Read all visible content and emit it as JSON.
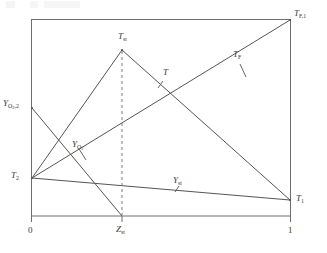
{
  "figure": {
    "type": "line-diagram",
    "frame_color": "#6e6e6e",
    "line_color": "#555555",
    "dashed_color": "#7a7a7a",
    "text_color": "#3a3a3a",
    "background": "#ffffff"
  },
  "axes": {
    "x_ticks": [
      {
        "id": "x0",
        "label": "0",
        "value": 0
      },
      {
        "id": "xst",
        "label": "Z",
        "sub": "st",
        "value": 0.35
      },
      {
        "id": "x1",
        "label": "1",
        "value": 1
      }
    ],
    "x_range": [
      0,
      1
    ],
    "grid": false
  },
  "labels": {
    "t_st": {
      "text": "T",
      "sub": "st"
    },
    "t_f1": {
      "text": "T",
      "sub": "F,1"
    },
    "t_f": {
      "text": "T",
      "sub": "F"
    },
    "t": {
      "text": "T",
      "sub": ""
    },
    "t_1": {
      "text": "T",
      "sub": "1"
    },
    "t_2": {
      "text": "T",
      "sub": "2"
    },
    "y_o2_2": {
      "text": "Y",
      "sub": "O2,2"
    },
    "y_o2": {
      "text": "Y",
      "sub": "O2"
    },
    "y_st": {
      "text": "Y",
      "sub": "st"
    },
    "x_zero": "0",
    "x_one": "1",
    "z_st": {
      "text": "Z",
      "sub": "st"
    }
  },
  "chart_data": {
    "type": "line",
    "title": "",
    "xlabel": "",
    "ylabel": "",
    "xlim": [
      0,
      1
    ],
    "ylim": [
      0,
      1
    ],
    "z_st": 0.35,
    "series": [
      {
        "name": "T",
        "label": "T",
        "style": "solid",
        "points": [
          [
            0,
            0.195
          ],
          [
            0.35,
            0.843
          ],
          [
            1,
            0.081
          ]
        ]
      },
      {
        "name": "T_F",
        "label": "T_F",
        "style": "solid",
        "points": [
          [
            0,
            0.195
          ],
          [
            1,
            1.0
          ]
        ]
      },
      {
        "name": "Y_O2",
        "label": "Y_O2",
        "style": "solid",
        "points": [
          [
            0,
            0.548
          ],
          [
            0.35,
            0.0
          ]
        ]
      },
      {
        "name": "Y_st",
        "label": "Y_st",
        "style": "solid",
        "points": [
          [
            0,
            0.195
          ],
          [
            1,
            0.081
          ]
        ]
      },
      {
        "name": "Z_st-marker",
        "label": "Z_st",
        "style": "dashed",
        "points": [
          [
            0.35,
            0.843
          ],
          [
            0.35,
            0.0
          ]
        ]
      }
    ],
    "annotations": [
      {
        "name": "T_st",
        "x": 0.35,
        "y": 0.843,
        "position": "above"
      },
      {
        "name": "T_F,1",
        "x": 1.0,
        "y": 1.0,
        "position": "right"
      },
      {
        "name": "T_1",
        "x": 1.0,
        "y": 0.081,
        "position": "right"
      },
      {
        "name": "T_2",
        "x": 0.0,
        "y": 0.195,
        "position": "left"
      },
      {
        "name": "Y_O2,2",
        "x": 0.0,
        "y": 0.548,
        "position": "left"
      },
      {
        "name": "T",
        "x": 0.56,
        "y": 0.6,
        "position": "leader"
      },
      {
        "name": "T_F",
        "x": 0.76,
        "y": 0.78,
        "position": "leader"
      },
      {
        "name": "Y_O2",
        "x": 0.24,
        "y": 0.34,
        "position": "leader"
      },
      {
        "name": "Y_st",
        "x": 0.6,
        "y": 0.15,
        "position": "leader"
      }
    ]
  }
}
